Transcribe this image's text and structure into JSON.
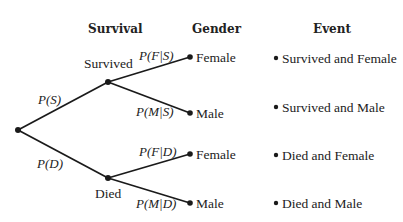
{
  "headers": {
    "survival": "Survival",
    "gender": "Gender",
    "event": "Event"
  },
  "nodes": {
    "survived": "Survived",
    "died": "Died",
    "female_s": "Female",
    "male_s": "Male",
    "female_d": "Female",
    "male_d": "Male"
  },
  "probabilities": {
    "p_s": "P(S)",
    "p_d": "P(D)",
    "p_f_given_s": "P(F|S)",
    "p_m_given_s": "P(M|S)",
    "p_f_given_d": "P(F|D)",
    "p_m_given_d": "P(M|D)"
  },
  "events": [
    "Survived and Female",
    "Survived and Male",
    "Died and Female",
    "Died and Male"
  ]
}
